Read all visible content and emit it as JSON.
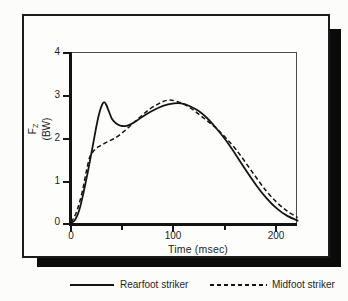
{
  "colors": {
    "ink": "#1f1f1f",
    "curve": "#141414",
    "box_border": "#1b1b1b",
    "shadow": "#0b0b0b",
    "background": "#fcfcfa"
  },
  "chart_data": {
    "type": "line",
    "title": "",
    "xlabel": "Time (msec)",
    "ylabel": "F_Z (BW)",
    "ylabel_symbol": "F",
    "ylabel_subscript": "Z",
    "ylabel_unit": "(BW)",
    "xlim": [
      0,
      225
    ],
    "ylim": [
      0,
      4
    ],
    "grid": false,
    "legend_position": "bottom",
    "xticks_major": [
      0,
      100,
      200
    ],
    "xticks_minor": [
      50,
      150
    ],
    "yticks": [
      4,
      3,
      2,
      1,
      0
    ],
    "xtick_labels": [
      "0",
      "100",
      "200"
    ],
    "ytick_labels": [
      "4",
      "3",
      "2",
      "1",
      "0"
    ],
    "series": [
      {
        "name": "Rearfoot striker",
        "line_style": "solid",
        "color": "#141414",
        "points": [
          [
            0,
            0.02
          ],
          [
            4,
            0.1
          ],
          [
            8,
            0.32
          ],
          [
            12,
            0.72
          ],
          [
            16,
            1.18
          ],
          [
            20,
            1.68
          ],
          [
            24,
            2.2
          ],
          [
            27,
            2.55
          ],
          [
            30,
            2.78
          ],
          [
            32,
            2.85
          ],
          [
            34,
            2.8
          ],
          [
            37,
            2.62
          ],
          [
            40,
            2.45
          ],
          [
            44,
            2.35
          ],
          [
            48,
            2.3
          ],
          [
            53,
            2.29
          ],
          [
            58,
            2.33
          ],
          [
            64,
            2.42
          ],
          [
            72,
            2.55
          ],
          [
            80,
            2.66
          ],
          [
            90,
            2.77
          ],
          [
            100,
            2.82
          ],
          [
            107,
            2.82
          ],
          [
            115,
            2.76
          ],
          [
            124,
            2.64
          ],
          [
            132,
            2.48
          ],
          [
            140,
            2.27
          ],
          [
            150,
            1.97
          ],
          [
            160,
            1.62
          ],
          [
            170,
            1.25
          ],
          [
            180,
            0.9
          ],
          [
            190,
            0.6
          ],
          [
            200,
            0.36
          ],
          [
            210,
            0.19
          ],
          [
            220,
            0.08
          ]
        ]
      },
      {
        "name": "Midfoot striker",
        "line_style": "dashed",
        "color": "#141414",
        "points": [
          [
            0,
            0.04
          ],
          [
            4,
            0.2
          ],
          [
            8,
            0.48
          ],
          [
            12,
            0.88
          ],
          [
            15,
            1.25
          ],
          [
            18,
            1.55
          ],
          [
            21,
            1.68
          ],
          [
            25,
            1.78
          ],
          [
            30,
            1.85
          ],
          [
            36,
            1.93
          ],
          [
            42,
            2.0
          ],
          [
            48,
            2.1
          ],
          [
            54,
            2.22
          ],
          [
            60,
            2.35
          ],
          [
            68,
            2.52
          ],
          [
            76,
            2.68
          ],
          [
            84,
            2.8
          ],
          [
            90,
            2.87
          ],
          [
            96,
            2.9
          ],
          [
            102,
            2.87
          ],
          [
            110,
            2.8
          ],
          [
            118,
            2.68
          ],
          [
            126,
            2.53
          ],
          [
            134,
            2.38
          ],
          [
            142,
            2.22
          ],
          [
            150,
            2.02
          ],
          [
            160,
            1.75
          ],
          [
            170,
            1.42
          ],
          [
            180,
            1.08
          ],
          [
            190,
            0.76
          ],
          [
            200,
            0.5
          ],
          [
            210,
            0.3
          ],
          [
            220,
            0.15
          ]
        ]
      }
    ]
  }
}
